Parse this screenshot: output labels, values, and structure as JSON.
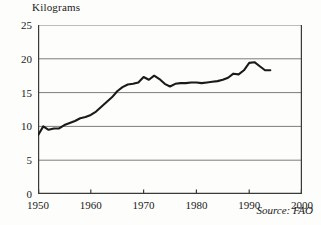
{
  "chart_data": {
    "type": "line",
    "title": "",
    "ylabel": "Kilograms",
    "xlabel": "",
    "ylim": [
      0,
      25
    ],
    "xlim": [
      1950,
      2000
    ],
    "yticks": [
      0,
      5,
      10,
      15,
      20,
      25
    ],
    "xticks": [
      1950,
      1960,
      1970,
      1980,
      1990,
      2000
    ],
    "grid": "horizontal",
    "legend": "none",
    "annotations": [
      {
        "name": "source-note",
        "text": "Source: FAO"
      }
    ],
    "series": [
      {
        "name": "World meat consumption per person",
        "color": "#1a1a1a",
        "x": [
          1950,
          1951,
          1952,
          1953,
          1954,
          1955,
          1956,
          1957,
          1958,
          1959,
          1960,
          1961,
          1962,
          1963,
          1964,
          1965,
          1966,
          1967,
          1968,
          1969,
          1970,
          1971,
          1972,
          1973,
          1974,
          1975,
          1976,
          1977,
          1978,
          1979,
          1980,
          1981,
          1982,
          1983,
          1984,
          1985,
          1986,
          1987,
          1988,
          1989,
          1990,
          1991,
          1992,
          1993,
          1994
        ],
        "y": [
          8.7,
          10.0,
          9.5,
          9.7,
          9.7,
          10.2,
          10.5,
          10.8,
          11.2,
          11.4,
          11.7,
          12.2,
          12.9,
          13.6,
          14.3,
          15.2,
          15.8,
          16.2,
          16.3,
          16.5,
          17.3,
          16.9,
          17.5,
          17.0,
          16.3,
          15.9,
          16.3,
          16.4,
          16.4,
          16.5,
          16.5,
          16.4,
          16.5,
          16.6,
          16.7,
          16.9,
          17.2,
          17.8,
          17.7,
          18.3,
          19.4,
          19.5,
          18.9,
          18.3,
          18.3
        ]
      }
    ]
  }
}
